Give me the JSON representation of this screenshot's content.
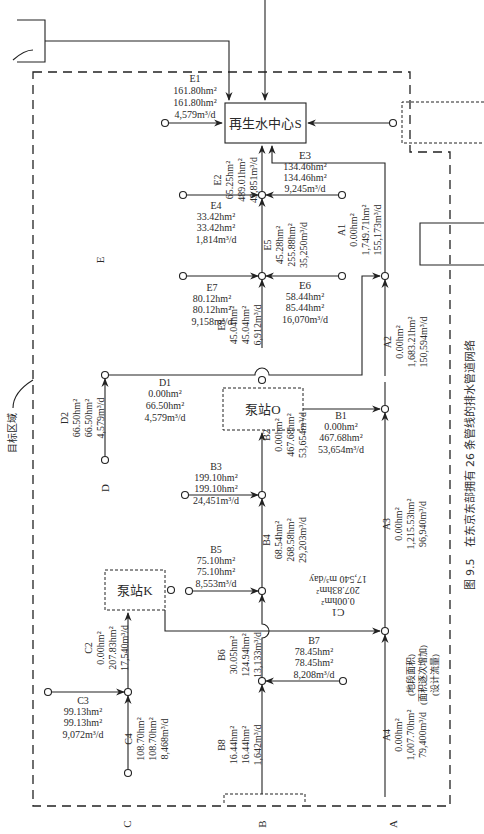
{
  "caption": "图 9.5　在东京东部拥有 26 条管线的排水管道网络",
  "target_area_label": "目标区域",
  "facilities": {
    "regen_center": "再生水中心S",
    "pump_o": "泵站O",
    "pump_k": "泵站K"
  },
  "trunks": {
    "A": "A",
    "B": "B",
    "C": "C",
    "D": "D",
    "E": "E"
  },
  "legend_notes": {
    "segment_area": "(地段面积)",
    "cumulative_area": "(面积逐次增加)",
    "design_flow": "(设计流量)"
  },
  "pipes": {
    "E1": {
      "id": "E1",
      "area": "161.80hm²",
      "cum": "161.80hm²",
      "flow": "4,579m³/d"
    },
    "E2": {
      "id": "E2",
      "area": "65.25hm²",
      "cum": "489.01hm²",
      "flow": "49,851m³/d"
    },
    "E3": {
      "id": "E3",
      "area": "134.46hm²",
      "cum": "134.46hm²",
      "flow": "9,245m³/d"
    },
    "E4": {
      "id": "E4",
      "area": "33.42hm²",
      "cum": "33.42hm²",
      "flow": "1,814m³/d"
    },
    "E5": {
      "id": "E5",
      "area": "45.28hm²",
      "cum": "255.88hm²",
      "flow": "35,250m³/d"
    },
    "E6": {
      "id": "E6",
      "area": "58.44hm²",
      "cum": "85.44hm²",
      "flow": "16,070m³/d"
    },
    "E7": {
      "id": "E7",
      "area": "80.12hm²",
      "cum": "80.12hm²",
      "flow": "9,158m³/d"
    },
    "E8": {
      "id": "E8",
      "area": "45.04hm²",
      "cum": "45.04hm²",
      "flow": "6,912m³/d"
    },
    "D1": {
      "id": "D1",
      "area": "0.00hm²",
      "cum": "66.50hm²",
      "flow": "4,579m³/d"
    },
    "D2": {
      "id": "D2",
      "area": "66.50hm²",
      "cum": "66.50hm²",
      "flow": "4,579m³/d"
    },
    "A1": {
      "id": "A1",
      "area": "0.00hm²",
      "cum": "1,749.71hm²",
      "flow": "155,173m³/d"
    },
    "A2": {
      "id": "A2",
      "area": "0.00hm²",
      "cum": "1,683.21hm²",
      "flow": "150,594m³/d"
    },
    "A3": {
      "id": "A3",
      "area": "0.00hm²",
      "cum": "1,215.53hm²",
      "flow": "96,940m³/d"
    },
    "A4": {
      "id": "A4",
      "area": "0.00hm²",
      "cum": "1,007.70hm²",
      "flow": "79,400m³/d"
    },
    "B1": {
      "id": "B1",
      "area": "0.00hm²",
      "cum": "467.68hm²",
      "flow": "53,654m³/d"
    },
    "B2": {
      "id": "B2",
      "area": "0.00hm²",
      "cum": "467.68hm²",
      "flow": "53,654m³/d"
    },
    "B3": {
      "id": "B3",
      "area": "199.10hm²",
      "cum": "199.10hm²",
      "flow": "24,451m³/d"
    },
    "B4": {
      "id": "B4",
      "area": "68.54hm²",
      "cum": "268.58hm²",
      "flow": "29,203m³/d"
    },
    "B5": {
      "id": "B5",
      "area": "75.10hm²",
      "cum": "75.10hm²",
      "flow": "8,553m³/d"
    },
    "B6": {
      "id": "B6",
      "area": "30.05hm²",
      "cum": "124.94hm²",
      "flow": "13,133m³/d"
    },
    "B7": {
      "id": "B7",
      "area": "78.45hm²",
      "cum": "78.45hm²",
      "flow": "8,208m³/d"
    },
    "B8": {
      "id": "B8",
      "area": "16.44hm²",
      "cum": "16.44hm²",
      "flow": "1,642m³/d"
    },
    "C1": {
      "id": "C1",
      "area": "0.00hm²",
      "cum": "207.83hm²",
      "flow": "17,540 m³/day"
    },
    "C2": {
      "id": "C2",
      "area": "0.00hm²",
      "cum": "207.83hm²",
      "flow": "17,540m³/d"
    },
    "C3": {
      "id": "C3",
      "area": "99.13hm²",
      "cum": "99.13hm²",
      "flow": "9,072m³/d"
    },
    "C4": {
      "id": "C4",
      "area": "108.70hm²",
      "cum": "108.70hm²",
      "flow": "8,468m³/d"
    }
  }
}
